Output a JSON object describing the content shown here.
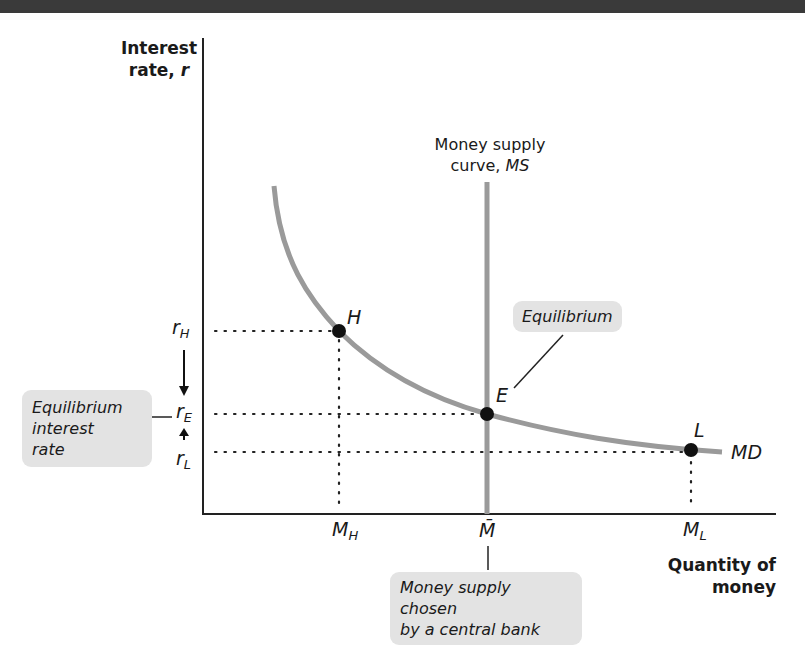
{
  "header_bar": {
    "color": "#3a3a3a"
  },
  "axes": {
    "y_label_line1": "Interest",
    "y_label_line2": "rate, ",
    "y_label_symbol": "r",
    "x_label_line1": "Quantity of",
    "x_label_line2": "money"
  },
  "curves": {
    "ms_label_line1": "Money supply",
    "ms_label_line2": "curve, ",
    "ms_label_symbol": "MS",
    "md_label": "MD",
    "curve_color": "#9a9a9a"
  },
  "points": {
    "H": "H",
    "E": "E",
    "L": "L"
  },
  "y_ticks": {
    "rH": "r",
    "rH_sub": "H",
    "rE": "r",
    "rE_sub": "E",
    "rL": "r",
    "rL_sub": "L"
  },
  "x_ticks": {
    "MH": "M",
    "MH_sub": "H",
    "Mbar": "M̄",
    "ML": "M",
    "ML_sub": "L"
  },
  "callouts": {
    "equilibrium": "Equilibrium",
    "eq_rate_line1": "Equilibrium",
    "eq_rate_line2": "interest",
    "eq_rate_line3": "rate",
    "ms_chosen_line1": "Money supply chosen",
    "ms_chosen_line2": "by a central bank"
  }
}
